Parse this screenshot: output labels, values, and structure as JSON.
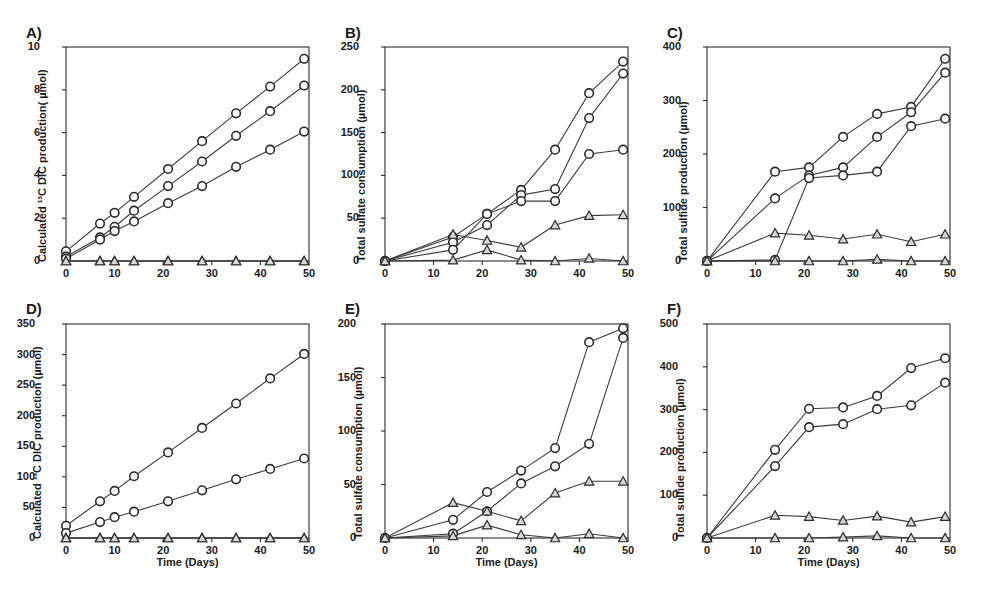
{
  "figure": {
    "shared_xlabel": "Time (Days)",
    "x_ticks": [
      0,
      10,
      20,
      30,
      40,
      50
    ],
    "marker_circle": "open-circle-marker",
    "marker_triangle": "filled-triangle-marker"
  },
  "chart_data": [
    {
      "id": "panel-a",
      "panel_label": "A)",
      "type": "line",
      "title": "",
      "xlabel": "",
      "ylabel": "Calculated ¹³C DIC production( µmol)",
      "xlim": [
        0,
        50
      ],
      "ylim": [
        0,
        10
      ],
      "x_ticks": [
        0,
        10,
        20,
        30,
        40,
        50
      ],
      "y_ticks": [
        0,
        2,
        4,
        6,
        8,
        10
      ],
      "grid": false,
      "legend": "none",
      "series": [
        {
          "name": "circle-1",
          "marker": "circle",
          "x": [
            0,
            7,
            10,
            14,
            21,
            28,
            35,
            42,
            49
          ],
          "values": [
            0.45,
            1.75,
            2.25,
            3.0,
            4.3,
            5.6,
            6.9,
            8.15,
            9.45
          ]
        },
        {
          "name": "circle-2",
          "marker": "circle",
          "x": [
            0,
            7,
            10,
            14,
            21,
            28,
            35,
            42,
            49
          ],
          "values": [
            0.2,
            1.1,
            1.6,
            2.35,
            3.5,
            4.65,
            5.85,
            7.0,
            8.2
          ]
        },
        {
          "name": "circle-3",
          "marker": "circle",
          "x": [
            0,
            7,
            10,
            14,
            21,
            28,
            35,
            42,
            49
          ],
          "values": [
            0.1,
            1.0,
            1.4,
            1.85,
            2.7,
            3.5,
            4.4,
            5.2,
            6.05
          ]
        },
        {
          "name": "triangle-1",
          "marker": "triangle",
          "x": [
            0,
            7,
            10,
            14,
            21,
            28,
            35,
            42,
            49
          ],
          "values": [
            0,
            0,
            0,
            0,
            0,
            0,
            0,
            0,
            0
          ]
        },
        {
          "name": "triangle-2",
          "marker": "triangle",
          "x": [
            0,
            7,
            10,
            14,
            21,
            28,
            35,
            42,
            49
          ],
          "values": [
            0,
            0,
            0,
            0,
            0,
            0,
            0,
            0,
            0
          ]
        }
      ]
    },
    {
      "id": "panel-b",
      "panel_label": "B)",
      "type": "line",
      "title": "",
      "xlabel": "",
      "ylabel": "Total sulfate consumption (µmol)",
      "xlim": [
        0,
        50
      ],
      "ylim": [
        0,
        250
      ],
      "x_ticks": [
        0,
        10,
        20,
        30,
        40,
        50
      ],
      "y_ticks": [
        0,
        50,
        100,
        150,
        200,
        250
      ],
      "grid": false,
      "legend": "none",
      "series": [
        {
          "name": "circle-1",
          "marker": "circle",
          "x": [
            0,
            14,
            21,
            28,
            35,
            42,
            49
          ],
          "values": [
            0,
            28,
            55,
            83,
            130,
            196,
            233
          ]
        },
        {
          "name": "circle-2",
          "marker": "circle",
          "x": [
            0,
            14,
            21,
            28,
            35,
            42,
            49
          ],
          "values": [
            0,
            22,
            42,
            77,
            84,
            167,
            219
          ]
        },
        {
          "name": "circle-3",
          "marker": "circle",
          "x": [
            0,
            14,
            21,
            28,
            35,
            42,
            49
          ],
          "values": [
            0,
            13,
            55,
            70,
            70,
            125,
            130
          ]
        },
        {
          "name": "triangle-1",
          "marker": "triangle",
          "x": [
            0,
            14,
            21,
            28,
            35,
            42,
            49
          ],
          "values": [
            0,
            31,
            24,
            16,
            42,
            53,
            54
          ]
        },
        {
          "name": "triangle-2",
          "marker": "triangle",
          "x": [
            0,
            14,
            21,
            28,
            35,
            42,
            49
          ],
          "values": [
            0,
            1,
            13,
            1,
            0,
            3,
            0
          ]
        }
      ]
    },
    {
      "id": "panel-c",
      "panel_label": "C)",
      "type": "line",
      "title": "",
      "xlabel": "",
      "ylabel": "Total sulfide production  (µmol)",
      "xlim": [
        0,
        50
      ],
      "ylim": [
        0,
        400
      ],
      "x_ticks": [
        0,
        10,
        20,
        30,
        40,
        50
      ],
      "y_ticks": [
        0,
        100,
        200,
        300,
        400
      ],
      "grid": false,
      "legend": "none",
      "series": [
        {
          "name": "circle-1",
          "marker": "circle",
          "x": [
            0,
            14,
            21,
            28,
            35,
            42,
            49
          ],
          "values": [
            0,
            167,
            175,
            232,
            275,
            288,
            378
          ]
        },
        {
          "name": "circle-2",
          "marker": "circle",
          "x": [
            0,
            14,
            21,
            28,
            35,
            42,
            49
          ],
          "values": [
            0,
            117,
            160,
            175,
            232,
            278,
            352
          ]
        },
        {
          "name": "circle-3",
          "marker": "circle",
          "x": [
            0,
            14,
            21,
            28,
            35,
            42,
            49
          ],
          "values": [
            0,
            2,
            155,
            160,
            167,
            252,
            266
          ]
        },
        {
          "name": "triangle-1",
          "marker": "triangle",
          "x": [
            0,
            14,
            21,
            28,
            35,
            42,
            49
          ],
          "values": [
            0,
            52,
            48,
            41,
            50,
            36,
            50
          ]
        },
        {
          "name": "triangle-2",
          "marker": "triangle",
          "x": [
            0,
            14,
            21,
            28,
            35,
            42,
            49
          ],
          "values": [
            0,
            0,
            0,
            0,
            3,
            0,
            0
          ]
        }
      ]
    },
    {
      "id": "panel-d",
      "panel_label": "D)",
      "type": "line",
      "title": "",
      "xlabel": "Time (Days)",
      "ylabel": "Calculated ¹³C DIC production (µmol)",
      "xlim": [
        0,
        50
      ],
      "ylim": [
        0,
        350
      ],
      "x_ticks": [
        0,
        10,
        20,
        30,
        40,
        50
      ],
      "y_ticks": [
        0,
        50,
        100,
        150,
        200,
        250,
        300,
        350
      ],
      "grid": false,
      "legend": "none",
      "series": [
        {
          "name": "circle-1",
          "marker": "circle",
          "x": [
            0,
            7,
            10,
            14,
            21,
            28,
            35,
            42,
            49
          ],
          "values": [
            20,
            60,
            77,
            101,
            140,
            180,
            220,
            261,
            301
          ]
        },
        {
          "name": "circle-2",
          "marker": "circle",
          "x": [
            0,
            7,
            10,
            14,
            21,
            28,
            35,
            42,
            49
          ],
          "values": [
            8,
            26,
            34,
            43,
            60,
            78,
            96,
            113,
            130
          ]
        },
        {
          "name": "triangle-1",
          "marker": "triangle",
          "x": [
            0,
            7,
            10,
            14,
            21,
            28,
            35,
            42,
            49
          ],
          "values": [
            0,
            0,
            0,
            0,
            0,
            0,
            0,
            0,
            0
          ]
        },
        {
          "name": "triangle-2",
          "marker": "triangle",
          "x": [
            0,
            7,
            10,
            14,
            21,
            28,
            35,
            42,
            49
          ],
          "values": [
            0,
            0,
            0,
            0,
            0,
            0,
            0,
            0,
            0
          ]
        }
      ]
    },
    {
      "id": "panel-e",
      "panel_label": "E)",
      "type": "line",
      "title": "",
      "xlabel": "Time (Days)",
      "ylabel": "Total sulfate consumption (µmol)",
      "xlim": [
        0,
        50
      ],
      "ylim": [
        0,
        200
      ],
      "x_ticks": [
        0,
        10,
        20,
        30,
        40,
        50
      ],
      "y_ticks": [
        0,
        50,
        100,
        150,
        200
      ],
      "grid": false,
      "legend": "none",
      "series": [
        {
          "name": "circle-1",
          "marker": "circle",
          "x": [
            0,
            14,
            21,
            28,
            35,
            42,
            49
          ],
          "values": [
            0,
            17,
            43,
            63,
            84,
            183,
            196
          ]
        },
        {
          "name": "circle-2",
          "marker": "circle",
          "x": [
            0,
            14,
            21,
            28,
            35,
            42,
            49
          ],
          "values": [
            0,
            4,
            25,
            51,
            67,
            88,
            187
          ]
        },
        {
          "name": "triangle-1",
          "marker": "triangle",
          "x": [
            0,
            14,
            21,
            28,
            35,
            42,
            49
          ],
          "values": [
            0,
            33,
            25,
            16,
            42,
            53,
            53
          ]
        },
        {
          "name": "triangle-2",
          "marker": "triangle",
          "x": [
            0,
            14,
            21,
            28,
            35,
            42,
            49
          ],
          "values": [
            0,
            2,
            12,
            3,
            0,
            4,
            0
          ]
        }
      ]
    },
    {
      "id": "panel-f",
      "panel_label": "F)",
      "type": "line",
      "title": "",
      "xlabel": "Time (Days)",
      "ylabel": "Total sulfide production  (µmol)",
      "xlim": [
        0,
        50
      ],
      "ylim": [
        0,
        500
      ],
      "x_ticks": [
        0,
        10,
        20,
        30,
        40,
        50
      ],
      "y_ticks": [
        0,
        100,
        200,
        300,
        400,
        500
      ],
      "grid": false,
      "legend": "none",
      "series": [
        {
          "name": "circle-1",
          "marker": "circle",
          "x": [
            0,
            14,
            21,
            28,
            35,
            42,
            49
          ],
          "values": [
            0,
            206,
            302,
            305,
            332,
            397,
            420
          ]
        },
        {
          "name": "circle-2",
          "marker": "circle",
          "x": [
            0,
            14,
            21,
            28,
            35,
            42,
            49
          ],
          "values": [
            0,
            168,
            259,
            266,
            301,
            310,
            363
          ]
        },
        {
          "name": "triangle-1",
          "marker": "triangle",
          "x": [
            0,
            14,
            21,
            28,
            35,
            42,
            49
          ],
          "values": [
            0,
            53,
            50,
            41,
            51,
            37,
            50
          ]
        },
        {
          "name": "triangle-2",
          "marker": "triangle",
          "x": [
            0,
            14,
            21,
            28,
            35,
            42,
            49
          ],
          "values": [
            0,
            0,
            0,
            2,
            5,
            0,
            0
          ]
        }
      ]
    }
  ]
}
